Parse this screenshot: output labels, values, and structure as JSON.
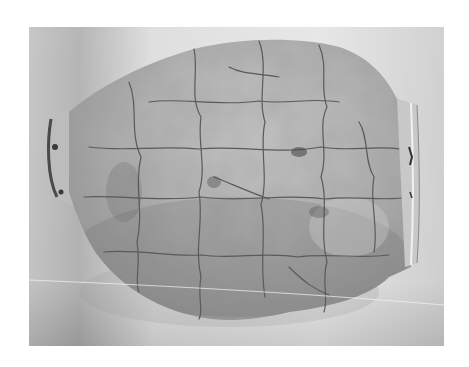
{
  "image": {
    "subject": "Reassembled ceramic vessel, lying on its side",
    "alt": "Black and white photograph of a cracked, reconstructed pottery jar with its base on the left and mouth rim on the right",
    "colors": {
      "page_background": "#ffffff",
      "backdrop_light": "#e6e6e6",
      "backdrop_dark": "#a9a9a9",
      "vessel_body": "#b4b4b4",
      "vessel_shadow": "#8a8a8a",
      "crack": "#5a5a5a"
    }
  }
}
